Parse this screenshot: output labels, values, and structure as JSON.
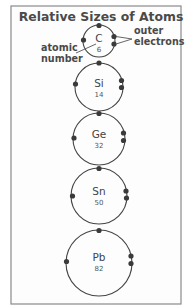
{
  "title": "Relative Sizes of Atoms",
  "annotations": {
    "outer_electrons_line1": "outer",
    "outer_electrons_line2": "electrons",
    "atomic_number_line1": "atomic",
    "atomic_number_line2": "number"
  },
  "colors": {
    "ink": "#444444",
    "electron": "#3a3a3a",
    "frame": "#8a8a8a",
    "background": "#fdfdfd"
  },
  "atoms": [
    {
      "symbol": "C",
      "atomic_number": "6",
      "cx": 99,
      "cy": 41,
      "r": 16
    },
    {
      "symbol": "Si",
      "atomic_number": "14",
      "cx": 99,
      "cy": 87,
      "r": 24
    },
    {
      "symbol": "Ge",
      "atomic_number": "32",
      "cx": 99,
      "cy": 139,
      "r": 26
    },
    {
      "symbol": "Sn",
      "atomic_number": "50",
      "cx": 99,
      "cy": 196,
      "r": 28
    },
    {
      "symbol": "Pb",
      "atomic_number": "82",
      "cx": 99,
      "cy": 263,
      "r": 33
    }
  ]
}
